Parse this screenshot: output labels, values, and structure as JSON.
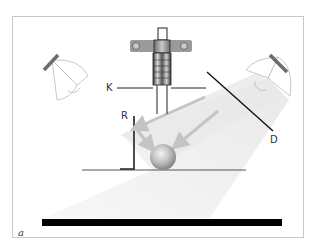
{
  "diagram": {
    "type": "lighting-setup-schematic",
    "panel_label": "a",
    "labels": {
      "camera": "K",
      "reflector": "R",
      "diffuser": "D"
    },
    "elements": [
      {
        "id": "camera",
        "label": "K",
        "description": "camera mounted on vertical column, viewing down"
      },
      {
        "id": "lamp-left",
        "description": "lamp at upper left, unused/off"
      },
      {
        "id": "lamp-right",
        "description": "lamp at upper right casting light cone toward object"
      },
      {
        "id": "diffuser",
        "label": "D",
        "description": "diagonal diffuser screen in front of right lamp"
      },
      {
        "id": "reflector",
        "label": "R",
        "description": "vertical reflector board left of object"
      },
      {
        "id": "object",
        "description": "spherical object on table"
      },
      {
        "id": "table",
        "description": "horizontal table surface line"
      },
      {
        "id": "base",
        "description": "black base bar in foreground"
      }
    ],
    "colors": {
      "frame": "#c8c8c8",
      "line": "#222222",
      "light_cone": "#ececec",
      "arrow": "#c4c4c4",
      "base_bar": "#000000",
      "sphere_light": "#f2f2f2",
      "sphere_dark": "#8a8a8a"
    }
  }
}
